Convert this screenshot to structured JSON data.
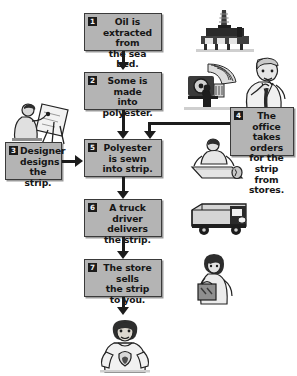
{
  "diagram": {
    "type": "process-flowchart",
    "background_color": "#ffffff",
    "box_fill": "#b4b4b4",
    "box_border": "#3a3a3a",
    "ink_color": "#1c1c1c"
  },
  "steps": [
    {
      "number": "1",
      "text": "Oil is extracted from the sea bed.",
      "lines": [
        "Oil is extracted",
        "from",
        "the sea bed."
      ],
      "illustration": "oil-rig-icon"
    },
    {
      "number": "2",
      "text": "Some is made into polyester.",
      "lines": [
        "Some is",
        "made",
        "into polyester."
      ],
      "illustration": "factory-machine-icon"
    },
    {
      "number": "3",
      "text": "Designer designs the strip.",
      "lines": [
        "Designer",
        "designs",
        "the strip."
      ],
      "illustration": "designer-at-easel-icon"
    },
    {
      "number": "4",
      "text": "The office takes orders for the strip from stores.",
      "lines": [
        "The office",
        "takes orders",
        "for the strip",
        "from stores."
      ],
      "illustration": "office-worker-on-phone-icon"
    },
    {
      "number": "5",
      "text": "Polyester is sewn into strip.",
      "lines": [
        "Polyester",
        "is sewn",
        "into strip."
      ],
      "illustration": "fabric-roll-worker-icon"
    },
    {
      "number": "6",
      "text": "A truck driver delivers the strip.",
      "lines": [
        "A truck driver",
        "delivers",
        "the strip."
      ],
      "illustration": "delivery-truck-icon"
    },
    {
      "number": "7",
      "text": "The store sells the strip to you.",
      "lines": [
        "The store sells",
        "the strip",
        "to you."
      ],
      "illustration": "shop-assistant-with-bag-icon"
    }
  ],
  "outcome": {
    "illustration": "boy-wearing-strip-icon",
    "caption": ""
  }
}
